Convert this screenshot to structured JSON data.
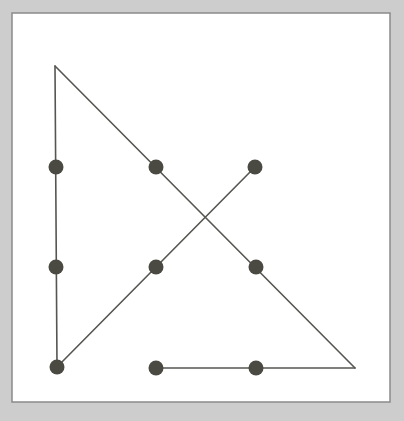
{
  "figure": {
    "width": 404,
    "height": 421,
    "colors": {
      "page_background": "#cdcdcd",
      "panel_background": "#ffffff",
      "frame_stroke": "#8a8a8a",
      "line_stroke": "#555551",
      "dot_fill": "#4a4a42"
    },
    "panel": {
      "x": 12,
      "y": 13,
      "width": 378,
      "height": 389,
      "stroke_width": 1.5
    },
    "line_width": 1.6,
    "dot_radius": 7.5
  },
  "chart_data": {
    "type": "scatter",
    "xlabel": "",
    "ylabel": "",
    "xlim": [
      12,
      390
    ],
    "ylim": [
      13,
      402
    ],
    "grid": false,
    "legend": false,
    "dot_grid": {
      "columns_x": [
        56,
        156,
        256
      ],
      "rows_y": [
        167,
        267,
        368
      ],
      "count": 9
    },
    "points": [
      {
        "id": "dot-top-left",
        "row": 0,
        "col": 0,
        "x": 56,
        "y": 167
      },
      {
        "id": "dot-top-center",
        "row": 0,
        "col": 1,
        "x": 156,
        "y": 167
      },
      {
        "id": "dot-top-right",
        "row": 0,
        "col": 2,
        "x": 255,
        "y": 167
      },
      {
        "id": "dot-middle-left",
        "row": 1,
        "col": 0,
        "x": 56,
        "y": 267
      },
      {
        "id": "dot-middle-center",
        "row": 1,
        "col": 1,
        "x": 156,
        "y": 267
      },
      {
        "id": "dot-middle-right",
        "row": 1,
        "col": 2,
        "x": 256,
        "y": 267
      },
      {
        "id": "dot-bottom-left",
        "row": 2,
        "col": 0,
        "x": 57,
        "y": 367
      },
      {
        "id": "dot-bottom-center",
        "row": 2,
        "col": 1,
        "x": 156,
        "y": 368
      },
      {
        "id": "dot-bottom-right",
        "row": 2,
        "col": 2,
        "x": 256,
        "y": 368
      }
    ],
    "segments": [
      {
        "id": "segment-left-vertical",
        "x1": 55,
        "y1": 66,
        "x2": 57,
        "y2": 367
      },
      {
        "id": "segment-descending-diagonal",
        "x1": 55,
        "y1": 66,
        "x2": 355,
        "y2": 368
      },
      {
        "id": "segment-bottom-horizontal",
        "x1": 156,
        "y1": 368,
        "x2": 355,
        "y2": 368
      },
      {
        "id": "segment-ascending-diagonal",
        "x1": 57,
        "y1": 367,
        "x2": 255,
        "y2": 167
      }
    ],
    "vertices": [
      {
        "id": "vertex-apex",
        "x": 55,
        "y": 66
      },
      {
        "id": "vertex-bottom-left",
        "x": 57,
        "y": 367
      },
      {
        "id": "vertex-bottom-right",
        "x": 355,
        "y": 368
      }
    ],
    "intersection": {
      "id": "diagonal-crossing",
      "x": 206,
      "y": 217
    }
  }
}
